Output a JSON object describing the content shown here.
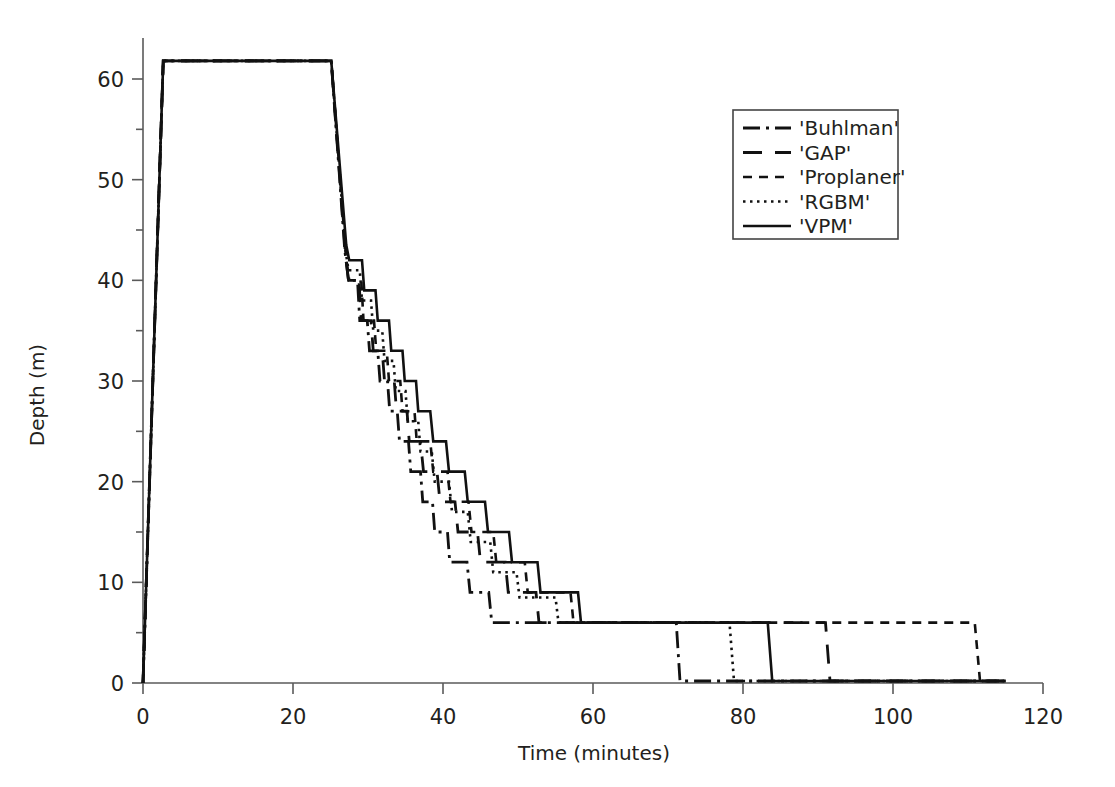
{
  "chart_data": {
    "type": "line",
    "title": "",
    "xlabel": "Time (minutes)",
    "ylabel": "Depth (m)",
    "xlim": [
      0,
      120
    ],
    "ylim": [
      0,
      65
    ],
    "xticks": [
      0,
      20,
      40,
      60,
      80,
      100,
      120
    ],
    "xtick_labels": [
      "0",
      "20",
      "40",
      "60",
      "80",
      "100",
      "120"
    ],
    "yticks": [
      0,
      10,
      20,
      30,
      40,
      50,
      60
    ],
    "ytick_labels": [
      "0",
      "10",
      "20",
      "30",
      "40",
      "50",
      "60"
    ],
    "y_minor_ticks": [
      5,
      15,
      25,
      35,
      45,
      55,
      65
    ],
    "grid": false,
    "y_inverted": false,
    "axis_note": "Depth plotted with 0 at bottom; curve shape is a dive profile (deep plateau then staircase ascent).",
    "legend": {
      "position": "upper-right",
      "border": true,
      "entries": [
        {
          "name": "'Buhlman'",
          "dash": "dashdot",
          "pattern": "18,6,3,6,3,6"
        },
        {
          "name": "'GAP'",
          "dash": "dashed-long",
          "pattern": "20,12"
        },
        {
          "name": "'Proplaner'",
          "dash": "dashed-short",
          "pattern": "10,7"
        },
        {
          "name": "'RGBM'",
          "dash": "dotted",
          "pattern": "2.5,4"
        },
        {
          "name": "'VPM'",
          "dash": "solid",
          "pattern": "none"
        }
      ]
    },
    "series": [
      {
        "name": "'Buhlman'",
        "dash": "dashdot",
        "color": "#111111",
        "points": [
          [
            0,
            0
          ],
          [
            2.7,
            61.8
          ],
          [
            25.1,
            61.8
          ],
          [
            26.9,
            43.0
          ],
          [
            27.4,
            40.0
          ],
          [
            28.6,
            40.0
          ],
          [
            28.9,
            36.0
          ],
          [
            29.9,
            36.0
          ],
          [
            30.2,
            33.0
          ],
          [
            31.3,
            33.0
          ],
          [
            31.6,
            30.0
          ],
          [
            32.6,
            30.0
          ],
          [
            32.9,
            27.0
          ],
          [
            33.9,
            27.0
          ],
          [
            34.2,
            24.0
          ],
          [
            35.4,
            24.0
          ],
          [
            35.7,
            21.0
          ],
          [
            37.0,
            21.0
          ],
          [
            37.3,
            18.0
          ],
          [
            38.6,
            18.0
          ],
          [
            38.9,
            15.0
          ],
          [
            40.6,
            15.0
          ],
          [
            40.9,
            12.0
          ],
          [
            43.2,
            12.0
          ],
          [
            43.6,
            9.0
          ],
          [
            46.1,
            9.0
          ],
          [
            46.5,
            6.0
          ],
          [
            71.1,
            6.0
          ],
          [
            71.6,
            0.2
          ],
          [
            115.0,
            0.2
          ]
        ]
      },
      {
        "name": "'GAP'",
        "dash": "dashed-long",
        "color": "#111111",
        "points": [
          [
            0,
            0
          ],
          [
            2.7,
            61.8
          ],
          [
            25.1,
            61.8
          ],
          [
            27.0,
            42.5
          ],
          [
            27.4,
            40.0
          ],
          [
            28.8,
            40.0
          ],
          [
            29.1,
            36.0
          ],
          [
            30.4,
            36.0
          ],
          [
            30.7,
            33.0
          ],
          [
            31.9,
            33.0
          ],
          [
            32.2,
            30.0
          ],
          [
            33.5,
            30.0
          ],
          [
            33.8,
            27.0
          ],
          [
            35.2,
            27.0
          ],
          [
            35.5,
            24.0
          ],
          [
            37.0,
            24.0
          ],
          [
            37.4,
            21.0
          ],
          [
            39.2,
            21.0
          ],
          [
            39.6,
            18.0
          ],
          [
            41.6,
            18.0
          ],
          [
            42.0,
            15.0
          ],
          [
            44.6,
            15.0
          ],
          [
            45.0,
            12.0
          ],
          [
            48.3,
            12.0
          ],
          [
            48.7,
            9.0
          ],
          [
            52.4,
            9.0
          ],
          [
            52.8,
            6.0
          ],
          [
            91.0,
            6.0
          ],
          [
            91.6,
            0.2
          ],
          [
            115.0,
            0.2
          ]
        ]
      },
      {
        "name": "'Proplaner'",
        "dash": "dashed-short",
        "color": "#111111",
        "points": [
          [
            0,
            0
          ],
          [
            2.7,
            61.8
          ],
          [
            25.1,
            61.8
          ],
          [
            27.1,
            42.0
          ],
          [
            27.5,
            40.0
          ],
          [
            29.1,
            40.0
          ],
          [
            29.4,
            36.0
          ],
          [
            30.8,
            36.0
          ],
          [
            31.1,
            33.0
          ],
          [
            32.5,
            33.0
          ],
          [
            32.8,
            30.0
          ],
          [
            34.3,
            30.0
          ],
          [
            34.6,
            27.0
          ],
          [
            36.2,
            27.0
          ],
          [
            36.5,
            24.0
          ],
          [
            38.3,
            24.0
          ],
          [
            38.7,
            21.0
          ],
          [
            40.6,
            21.0
          ],
          [
            41.0,
            18.0
          ],
          [
            43.4,
            18.0
          ],
          [
            43.8,
            15.0
          ],
          [
            46.7,
            15.0
          ],
          [
            47.1,
            12.0
          ],
          [
            50.9,
            12.0
          ],
          [
            51.3,
            9.0
          ],
          [
            57.0,
            9.0
          ],
          [
            57.4,
            6.0
          ],
          [
            110.9,
            6.0
          ],
          [
            111.6,
            0.2
          ],
          [
            115.0,
            0.2
          ]
        ]
      },
      {
        "name": "'RGBM'",
        "dash": "dotted",
        "color": "#111111",
        "points": [
          [
            0,
            0
          ],
          [
            2.7,
            61.8
          ],
          [
            25.1,
            61.8
          ],
          [
            27.0,
            43.0
          ],
          [
            27.4,
            41.0
          ],
          [
            28.9,
            41.0
          ],
          [
            29.2,
            38.0
          ],
          [
            30.4,
            38.0
          ],
          [
            30.7,
            35.0
          ],
          [
            31.9,
            35.0
          ],
          [
            32.2,
            32.0
          ],
          [
            33.4,
            32.0
          ],
          [
            33.7,
            29.0
          ],
          [
            35.0,
            29.0
          ],
          [
            35.3,
            26.0
          ],
          [
            36.7,
            26.0
          ],
          [
            37.0,
            23.0
          ],
          [
            38.5,
            23.0
          ],
          [
            38.9,
            20.0
          ],
          [
            40.8,
            20.0
          ],
          [
            41.2,
            17.0
          ],
          [
            43.3,
            17.0
          ],
          [
            43.7,
            14.0
          ],
          [
            46.3,
            14.0
          ],
          [
            46.7,
            11.0
          ],
          [
            49.8,
            11.0
          ],
          [
            50.2,
            8.5
          ],
          [
            55.0,
            8.5
          ],
          [
            55.4,
            6.0
          ],
          [
            78.2,
            6.0
          ],
          [
            78.8,
            0.2
          ],
          [
            115.0,
            0.2
          ]
        ]
      },
      {
        "name": "'VPM'",
        "dash": "solid",
        "color": "#111111",
        "points": [
          [
            0,
            0
          ],
          [
            2.7,
            61.8
          ],
          [
            25.1,
            61.8
          ],
          [
            27.1,
            43.5
          ],
          [
            27.5,
            42.0
          ],
          [
            29.2,
            42.0
          ],
          [
            29.5,
            39.0
          ],
          [
            31.0,
            39.0
          ],
          [
            31.3,
            36.0
          ],
          [
            32.8,
            36.0
          ],
          [
            33.1,
            33.0
          ],
          [
            34.6,
            33.0
          ],
          [
            34.9,
            30.0
          ],
          [
            36.4,
            30.0
          ],
          [
            36.7,
            27.0
          ],
          [
            38.3,
            27.0
          ],
          [
            38.7,
            24.0
          ],
          [
            40.4,
            24.0
          ],
          [
            40.8,
            21.0
          ],
          [
            42.9,
            21.0
          ],
          [
            43.3,
            18.0
          ],
          [
            45.6,
            18.0
          ],
          [
            46.0,
            15.0
          ],
          [
            48.8,
            15.0
          ],
          [
            49.2,
            12.0
          ],
          [
            52.6,
            12.0
          ],
          [
            53.0,
            9.0
          ],
          [
            58.0,
            9.0
          ],
          [
            58.4,
            6.0
          ],
          [
            83.3,
            6.0
          ],
          [
            83.9,
            0.2
          ],
          [
            115.0,
            0.2
          ]
        ]
      }
    ]
  },
  "axes": {
    "x_label": "Time (minutes)",
    "y_label": "Depth (m)"
  }
}
